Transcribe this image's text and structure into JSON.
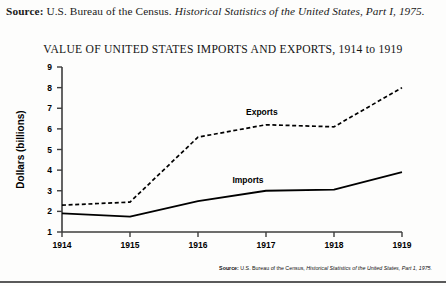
{
  "header": {
    "label": "Source:",
    "text_plain": " U.S. Bureau of the Census. ",
    "text_italic": "Historical Statistics of the United States, Part I, 1975."
  },
  "figure": {
    "title": "VALUE OF UNITED STATES IMPORTS AND EXPORTS, 1914 to 1919",
    "source_label": "Source:",
    "source_plain": " U.S. Bureau of the Census, ",
    "source_italic": "Historical Statistics of the United States, Part 1, 1975."
  },
  "chart_data": {
    "type": "line",
    "title": "VALUE OF UNITED STATES IMPORTS AND EXPORTS, 1914 to 1919",
    "xlabel": "",
    "ylabel": "Dollars (billions)",
    "categories": [
      "1914",
      "1915",
      "1916",
      "1917",
      "1918",
      "1919"
    ],
    "x": [
      1914,
      1915,
      1916,
      1917,
      1918,
      1919
    ],
    "xlim": [
      1914,
      1919
    ],
    "ylim": [
      1,
      9
    ],
    "yticks": [
      1,
      2,
      3,
      4,
      5,
      6,
      7,
      8,
      9
    ],
    "ytick_labels": [
      "1",
      "2",
      "3",
      "4",
      "5",
      "6",
      "7",
      "8",
      "9"
    ],
    "grid": false,
    "legend": "inline-annotations",
    "series": [
      {
        "name": "Exports",
        "style": "dashed",
        "color": "#000000",
        "values": [
          2.3,
          2.45,
          5.6,
          6.2,
          6.1,
          8.0
        ],
        "label_x": 1917.0,
        "label_y": 6.75
      },
      {
        "name": "Imports",
        "style": "solid",
        "color": "#000000",
        "values": [
          1.9,
          1.75,
          2.5,
          3.0,
          3.05,
          3.9
        ],
        "label_x": 1916.8,
        "label_y": 3.45
      }
    ],
    "annotations": [
      "Exports",
      "Imports"
    ]
  }
}
